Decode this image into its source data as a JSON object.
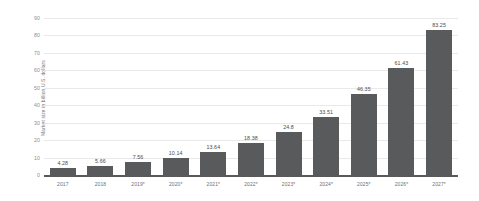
{
  "chart_data": {
    "type": "bar",
    "title": "",
    "xlabel": "",
    "ylabel": "Market size in billion U.S. dollars",
    "ylim": [
      0,
      90
    ],
    "yticks": [
      0,
      10,
      20,
      30,
      40,
      50,
      60,
      70,
      80,
      90
    ],
    "grid": true,
    "legend": null,
    "categories": [
      "2017",
      "2018",
      "2019*",
      "2020*",
      "2021*",
      "2022*",
      "2023*",
      "2024*",
      "2025*",
      "2026*",
      "2027*"
    ],
    "values": [
      4.28,
      5.66,
      7.56,
      10.14,
      13.64,
      18.38,
      24.8,
      33.51,
      46.35,
      61.43,
      83.25
    ],
    "value_labels": [
      "4.28",
      "5.66",
      "7.56",
      "10.14",
      "13.64",
      "18.38",
      "24.8",
      "33.51",
      "46.35",
      "61.43",
      "83.25"
    ],
    "bar_color": "#595a5c",
    "grid_color": "#e9e9e9",
    "axis_color": "#595959",
    "text_color": "#6f6f6f"
  }
}
